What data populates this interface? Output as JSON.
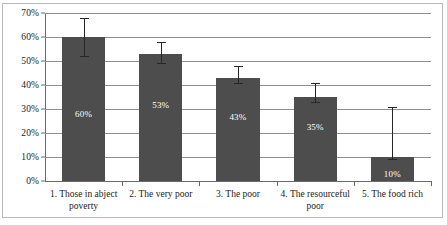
{
  "chart_data": {
    "type": "bar",
    "title": "",
    "subtitle": "",
    "xlabel": "",
    "ylabel": "",
    "ylim": [
      0,
      70
    ],
    "ytick_step": 10,
    "ytick_labels": [
      "0%",
      "10%",
      "20%",
      "30%",
      "40%",
      "50%",
      "60%",
      "70%"
    ],
    "ytick_values": [
      0,
      10,
      20,
      30,
      40,
      50,
      60,
      70
    ],
    "grid": true,
    "grid_axis": "y",
    "legend": false,
    "legend_position": "none",
    "categories": [
      "1. Those in abject poverty",
      "2. The very poor",
      "3. The poor",
      "4. The resourceful poor",
      "5. The food rich"
    ],
    "values": [
      60,
      53,
      43,
      35,
      10
    ],
    "value_labels": [
      "60%",
      "53%",
      "43%",
      "35%",
      "10%"
    ],
    "error_bars": {
      "lower": [
        52,
        49,
        41,
        33,
        9
      ],
      "upper": [
        68,
        58,
        48,
        41,
        31
      ]
    },
    "bar_color": "#4d4d4d",
    "value_label_color": "#ffffff",
    "axis_color": "#6a6a6a",
    "gridline_color": "#8f8f8f",
    "error_bar_color": "#262626"
  }
}
